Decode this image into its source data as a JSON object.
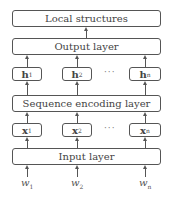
{
  "diagram": {
    "layers": {
      "local_structures": "Local structures",
      "output": "Output layer",
      "sequence_encoding": "Sequence encoding layer",
      "input": "Input layer"
    },
    "hidden_nodes": [
      {
        "base": "h",
        "sub": "1"
      },
      {
        "base": "h",
        "sub": "2"
      },
      {
        "base": "h",
        "sub": "n"
      }
    ],
    "input_nodes": [
      {
        "base": "x",
        "sub": "1"
      },
      {
        "base": "x",
        "sub": "2"
      },
      {
        "base": "x",
        "sub": "n"
      }
    ],
    "word_inputs": [
      {
        "base": "w",
        "sub": "1"
      },
      {
        "base": "w",
        "sub": "2"
      },
      {
        "base": "w",
        "sub": "n"
      }
    ],
    "ellipsis": "···"
  }
}
